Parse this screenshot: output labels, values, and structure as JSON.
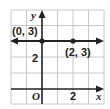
{
  "diagram": {
    "type": "coordinate-plane",
    "axes": {
      "x_label": "x",
      "y_label": "y",
      "origin_label": "O",
      "x_tick_label": "2",
      "y_tick_label": "2"
    },
    "line": {
      "equation": "y = 3",
      "kind": "horizontal",
      "color": "#222222"
    },
    "points": [
      {
        "label": "(0, 3)",
        "x": 0,
        "y": 3
      },
      {
        "label": "(2, 3)",
        "x": 2,
        "y": 3
      }
    ],
    "grid": {
      "x_range": [
        -2,
        4
      ],
      "y_range": [
        -1,
        5
      ],
      "cell_units": 1,
      "grid_color": "#c8c8c8"
    }
  }
}
